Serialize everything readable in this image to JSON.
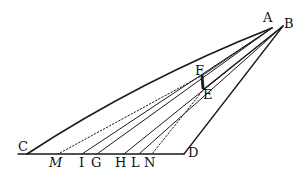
{
  "diagram": {
    "type": "geometric-construction",
    "stroke_color": "#1a1a1a",
    "background": "#ffffff",
    "points": {
      "A": [
        272,
        28
      ],
      "B": [
        283,
        26
      ],
      "F": [
        203,
        75
      ],
      "E": [
        204,
        89
      ],
      "C": [
        27,
        154
      ],
      "D": [
        184,
        154
      ],
      "M": [
        58,
        154
      ],
      "I": [
        82,
        154
      ],
      "G": [
        97,
        154
      ],
      "H": [
        124,
        154
      ],
      "L": [
        139,
        154
      ],
      "N": [
        152,
        154
      ]
    },
    "labels": {
      "A": "A",
      "B": "B",
      "C": "C",
      "D": "D",
      "E": "E",
      "F": "F",
      "M": "M",
      "I": "I",
      "G": "G",
      "H": "H",
      "L": "L",
      "N": "N"
    },
    "segments": [
      {
        "from": "C",
        "to": "D",
        "style": "solid"
      },
      {
        "from": "C",
        "to": "A",
        "style": "solid-curve"
      },
      {
        "from": "B",
        "to": "D",
        "style": "solid"
      },
      {
        "from": "A",
        "to": "I",
        "style": "solid"
      },
      {
        "from": "A",
        "to": "G",
        "style": "solid"
      },
      {
        "from": "B",
        "to": "H",
        "style": "solid"
      },
      {
        "from": "B",
        "to": "L",
        "style": "solid"
      },
      {
        "from": "F",
        "to": "M",
        "style": "dotted"
      },
      {
        "from": "E",
        "to": "N",
        "style": "dotted"
      },
      {
        "from": "F",
        "to": "E",
        "style": "hatched"
      }
    ]
  }
}
